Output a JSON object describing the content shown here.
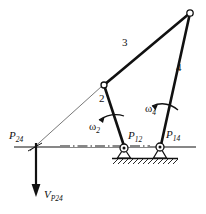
{
  "figure": {
    "kind": "four-bar-linkage-velocity-diagram",
    "background_color": "#ffffff",
    "ink_color": "#111111"
  },
  "labels": {
    "link2": "2",
    "link3": "3",
    "link4": "4",
    "omega2": "ω",
    "omega2_sub": "2",
    "omega4": "ω",
    "omega4_sub": "4",
    "p12": "P",
    "p12_sub": "12",
    "p14": "P",
    "p14_sub": "14",
    "p24": "P",
    "p24_sub": "24",
    "vp24": "V",
    "vp24_sub": "P",
    "vp24_sub2": "24"
  },
  "geometry": {
    "p24": [
      36,
      146
    ],
    "p12": [
      124,
      148
    ],
    "p14": [
      160,
      147
    ],
    "joint_a": [
      104,
      85
    ],
    "joint_b": [
      190,
      13
    ],
    "ground_line_start": [
      14,
      147
    ],
    "ground_line_end": [
      196,
      147
    ],
    "velocity_arrow_tip": [
      36,
      196
    ],
    "construction_line": [
      [
        36,
        146
      ],
      [
        104,
        85
      ]
    ]
  }
}
